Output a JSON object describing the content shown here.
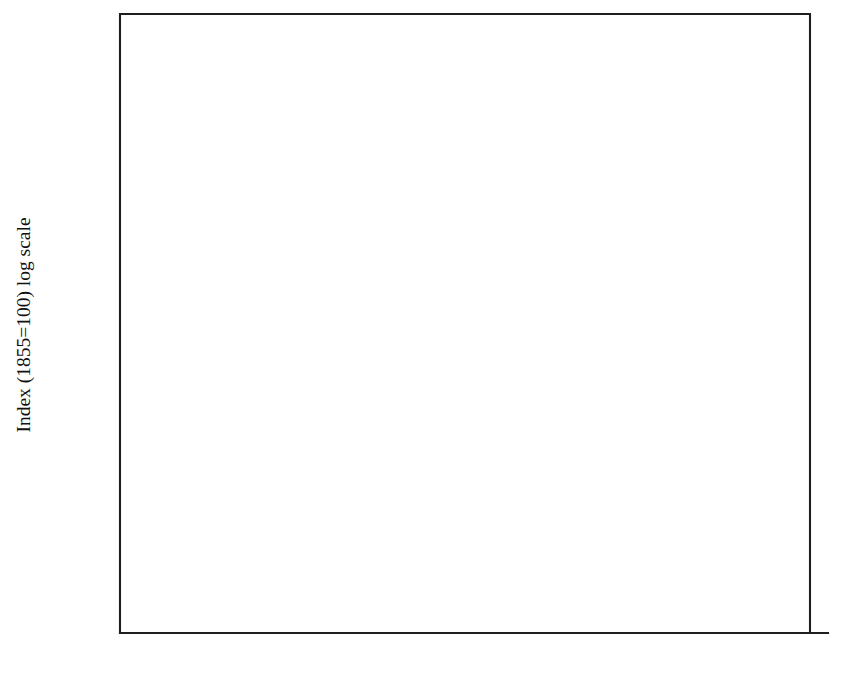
{
  "chart_data": {
    "type": "line",
    "title": "",
    "xlabel": "",
    "ylabel": "Index (1855=100) log scale",
    "yscale": "log",
    "ylim": [
      100,
      1000
    ],
    "xlim": [
      1855,
      1975
    ],
    "grid": false,
    "legend_position": "inline-annotations",
    "y_ticks": [
      100,
      150,
      200,
      250,
      300,
      400,
      500,
      600,
      700,
      800,
      1000
    ],
    "y_tick_labels": [
      "100",
      "150",
      "200",
      "250",
      "300",
      "400",
      "500",
      "600",
      "700",
      "800",
      "1,000"
    ],
    "x_ticks": [
      1855,
      1860,
      1865,
      1870,
      1875,
      1880,
      1885,
      1890,
      1895,
      1900,
      1905,
      1910,
      1915,
      1920,
      1925,
      1930,
      1935,
      1940,
      1945,
      1950,
      1955,
      1960,
      1965,
      1970,
      1975
    ],
    "x_tick_labels_shown": [
      "1855",
      "1865",
      "1875",
      "1885",
      "1895",
      "1905",
      "1915",
      "1925",
      "1935",
      "1945",
      "1955",
      "1965",
      "1975"
    ],
    "x_tick_label_step": 10,
    "series": [
      {
        "name": "Gross total assets",
        "style": "dotted",
        "color": "#161616",
        "label_text": "Gross total assets",
        "label_x": 1876.5,
        "label_y": 343,
        "segments": [
          {
            "x": [
              1855,
              1860,
              1865,
              1870,
              1873,
              1875,
              1880,
              1885,
              1890,
              1895,
              1900,
              1905,
              1910,
              1913
            ],
            "y": [
              100,
              113,
              126,
              142,
              153,
              160,
              181,
              203,
              228,
              255,
              288,
              322,
              367,
              397
            ]
          },
          {
            "x": [
              1922,
              1925,
              1930,
              1935,
              1937
            ],
            "y": [
              352,
              373,
              393,
              418,
              426
            ]
          },
          {
            "x": [
              1948,
              1952,
              1955,
              1958,
              1962,
              1966,
              1970,
              1973
            ],
            "y": [
              378,
              418,
              452,
              518,
              600,
              690,
              775,
              830
            ]
          }
        ],
        "markers": [
          {
            "x": 1873,
            "y": 153
          },
          {
            "x": 1913,
            "y": 397
          },
          {
            "x": 1925,
            "y": 373
          },
          {
            "x": 1937,
            "y": 426
          },
          {
            "x": 1952,
            "y": 418
          },
          {
            "x": 1955,
            "y": 452
          },
          {
            "x": 1958,
            "y": 518
          },
          {
            "x": 1962,
            "y": 600
          },
          {
            "x": 1966,
            "y": 690
          },
          {
            "x": 1973,
            "y": 830
          }
        ]
      },
      {
        "name": "Gross domestic fixed capital",
        "style": "solid",
        "color": "#161616",
        "label_text": "Gross domestic fixed capital",
        "label_x": 1934,
        "label_y": 545,
        "segments": [
          {
            "x": [
              1855,
              1860,
              1865,
              1870,
              1875,
              1880,
              1885,
              1890,
              1895,
              1900,
              1905,
              1910,
              1913
            ],
            "y": [
              100,
              110,
              122,
              136,
              152,
              170,
              188,
              205,
              222,
              248,
              280,
              298,
              305
            ]
          },
          {
            "x": [
              1920,
              1925,
              1930,
              1935,
              1937
            ],
            "y": [
              318,
              336,
              372,
              412,
              428
            ]
          },
          {
            "x": [
              1950,
              1955,
              1960,
              1965,
              1970,
              1974
            ],
            "y": [
              448,
              512,
              590,
              680,
              810,
              960
            ]
          }
        ],
        "markers": []
      },
      {
        "name": "Net domestic fixed capital",
        "style": "dashed",
        "color": "#161616",
        "label_text": "Net domestic fixed capital",
        "label_x": 1944,
        "label_y": 288,
        "segments": [
          {
            "x": [
              1855,
              1860,
              1865,
              1870,
              1875,
              1880,
              1885,
              1890,
              1895,
              1900,
              1905,
              1910,
              1913
            ],
            "y": [
              100,
              107,
              117,
              130,
              145,
              162,
              180,
              194,
              208,
              232,
              262,
              278,
              283
            ]
          },
          {
            "x": [
              1920,
              1925,
              1930,
              1935,
              1938
            ],
            "y": [
              262,
              278,
              305,
              348,
              375
            ]
          },
          {
            "x": [
              1948,
              1952,
              1955,
              1960,
              1965,
              1970,
              1974
            ],
            "y": [
              372,
              418,
              455,
              560,
              672,
              808,
              965
            ]
          }
        ],
        "markers": []
      }
    ],
    "marker_symbol": "plus",
    "annotations": [
      {
        "name": "gross-total-assets-label",
        "text": "Gross total assets"
      },
      {
        "name": "gross-domestic-fixed-capital-label",
        "text": "Gross domestic fixed capital"
      },
      {
        "name": "net-domestic-fixed-capital-label",
        "text": "Net domestic fixed capital"
      }
    ]
  }
}
